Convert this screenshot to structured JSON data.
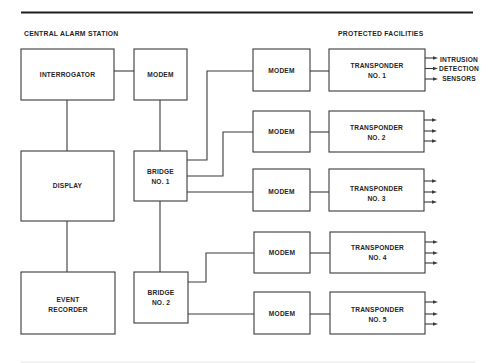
{
  "sections": {
    "left": "CENTRAL ALARM STATION",
    "right": "PROTECTED FACILITIES"
  },
  "nodes": {
    "interrogator": {
      "lines": [
        "INTERROGATOR"
      ]
    },
    "cas_modem": {
      "lines": [
        "MODEM"
      ]
    },
    "display": {
      "lines": [
        "DISPLAY"
      ]
    },
    "bridge_1": {
      "lines": [
        "BRIDGE",
        "NO. 1"
      ]
    },
    "event_recorder": {
      "lines": [
        "EVENT",
        "RECORDER"
      ]
    },
    "bridge_2": {
      "lines": [
        "BRIDGE",
        "NO. 2"
      ]
    },
    "modem_1": {
      "lines": [
        "MODEM"
      ]
    },
    "modem_2": {
      "lines": [
        "MODEM"
      ]
    },
    "modem_3": {
      "lines": [
        "MODEM"
      ]
    },
    "modem_4": {
      "lines": [
        "MODEM"
      ]
    },
    "modem_5": {
      "lines": [
        "MODEM"
      ]
    },
    "transponder_1": {
      "lines": [
        "TRANSPONDER",
        "NO. 1"
      ]
    },
    "transponder_2": {
      "lines": [
        "TRANSPONDER",
        "NO. 2"
      ]
    },
    "transponder_3": {
      "lines": [
        "TRANSPONDER",
        "NO. 3"
      ]
    },
    "transponder_4": {
      "lines": [
        "TRANSPONDER",
        "NO. 4"
      ]
    },
    "transponder_5": {
      "lines": [
        "TRANSPONDER",
        "NO. 5"
      ]
    }
  },
  "edges": [
    {
      "from": "interrogator",
      "to": "cas_modem"
    },
    {
      "from": "interrogator",
      "to": "display"
    },
    {
      "from": "display",
      "to": "event_recorder"
    },
    {
      "from": "cas_modem",
      "to": "bridge_1"
    },
    {
      "from": "bridge_1",
      "to": "bridge_2"
    },
    {
      "from": "bridge_1",
      "to": "modem_1"
    },
    {
      "from": "bridge_1",
      "to": "modem_2"
    },
    {
      "from": "bridge_1",
      "to": "modem_3"
    },
    {
      "from": "bridge_2",
      "to": "modem_4"
    },
    {
      "from": "bridge_2",
      "to": "modem_5"
    },
    {
      "from": "modem_1",
      "to": "transponder_1"
    },
    {
      "from": "modem_2",
      "to": "transponder_2"
    },
    {
      "from": "modem_3",
      "to": "transponder_3"
    },
    {
      "from": "modem_4",
      "to": "transponder_4"
    },
    {
      "from": "modem_5",
      "to": "transponder_5"
    }
  ],
  "sensor_outputs_per_transponder": 3,
  "sensor_label": [
    "INTRUSION",
    "DETECTION",
    "SENSORS"
  ]
}
